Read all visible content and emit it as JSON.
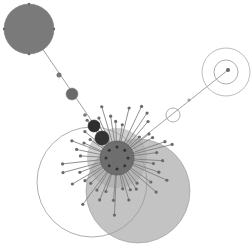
{
  "diagram": {
    "type": "radial-network-bubble-graph",
    "colors": {
      "background": "#ffffff",
      "large_node_fill": "#7a7a7a",
      "big_disc_fill": "#b8b8b8",
      "hub_fill": "#6e6e6e",
      "dark_node_fill": "#3a3a3a",
      "edge": "#8a8a8a",
      "outline": "#9a9a9a"
    },
    "nodes": [
      {
        "id": "top-left-node",
        "cx": 29,
        "cy": 29,
        "r": 25,
        "fill": "#7a7a7a",
        "stroke": "#777777"
      },
      {
        "id": "big-disc",
        "cx": 138,
        "cy": 191,
        "r": 52,
        "fill": "#b8b8b8",
        "stroke": "#999999"
      },
      {
        "id": "outline-ring",
        "cx": 92,
        "cy": 182,
        "r": 55,
        "fill": "none",
        "stroke": "#9a9a9a"
      },
      {
        "id": "hub",
        "cx": 117,
        "cy": 158,
        "r": 17,
        "fill": "#6e6e6e",
        "stroke": "#555555"
      },
      {
        "id": "hub-halo",
        "cx": 117,
        "cy": 158,
        "r": 30,
        "fill": "#a8a8a8",
        "stroke": "none"
      },
      {
        "id": "dark-node-1",
        "cx": 94,
        "cy": 126,
        "r": 6,
        "fill": "#2e2e2e",
        "stroke": "#222222"
      },
      {
        "id": "dark-node-2",
        "cx": 102,
        "cy": 138,
        "r": 7,
        "fill": "#333333",
        "stroke": "#222222"
      },
      {
        "id": "mid-node",
        "cx": 72,
        "cy": 94,
        "r": 6,
        "fill": "#6a6a6a",
        "stroke": "#888888"
      },
      {
        "id": "small-node-1",
        "cx": 59,
        "cy": 75,
        "r": 2.5,
        "fill": "#777777",
        "stroke": "none"
      },
      {
        "id": "small-node-2",
        "cx": 85,
        "cy": 115,
        "r": 1.8,
        "fill": "#777777",
        "stroke": "none"
      },
      {
        "id": "ring-small",
        "cx": 173,
        "cy": 115,
        "r": 7,
        "fill": "none",
        "stroke": "#999999"
      },
      {
        "id": "dot-line",
        "cx": 189,
        "cy": 100,
        "r": 1.5,
        "fill": "#999999",
        "stroke": "none"
      },
      {
        "id": "ring-outer-right",
        "cx": 226,
        "cy": 72,
        "r": 24,
        "fill": "none",
        "stroke": "#aaaaaa"
      },
      {
        "id": "ring-inner-right",
        "cx": 226,
        "cy": 72,
        "r": 12,
        "fill": "none",
        "stroke": "#999999"
      },
      {
        "id": "right-center-dot",
        "cx": 228,
        "cy": 70,
        "r": 2,
        "fill": "#666666",
        "stroke": "none"
      }
    ],
    "edges": [
      {
        "x1": 29,
        "y1": 29,
        "x2": 117,
        "y2": 158
      },
      {
        "x1": 117,
        "y1": 158,
        "x2": 228,
        "y2": 70
      }
    ],
    "spokes": {
      "center": [
        117,
        158
      ],
      "count": 46,
      "inner_radius": 12,
      "min_length": 30,
      "max_length": 58,
      "tip_radius": 1.6,
      "color": "#7c7c7c"
    }
  }
}
